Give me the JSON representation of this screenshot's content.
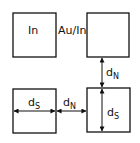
{
  "diagram": {
    "squares": [
      {
        "id": "in-square",
        "label": "In",
        "x": 13,
        "y": 13,
        "w": 43,
        "h": 44
      },
      {
        "id": "auin-square",
        "label": "",
        "x": 87,
        "y": 13,
        "w": 42,
        "h": 44
      },
      {
        "id": "bottom-left-square",
        "label": "",
        "x": 13,
        "y": 89,
        "w": 43,
        "h": 44
      },
      {
        "id": "bottom-right-square",
        "label": "",
        "x": 87,
        "y": 88,
        "w": 43,
        "h": 44
      }
    ],
    "labels": {
      "in": "In",
      "au_in": "Au/In",
      "dn_vertical": {
        "main": "d",
        "sub": "N"
      },
      "ds_vertical": {
        "main": "d",
        "sub": "S"
      },
      "ds_horizontal": {
        "main": "d",
        "sub": "S"
      },
      "dn_horizontal": {
        "main": "d",
        "sub": "N"
      }
    },
    "color": "#111111"
  }
}
